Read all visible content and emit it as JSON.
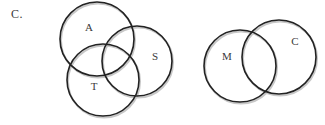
{
  "option_label": "C.",
  "diagrams": [
    {
      "name": "three-set-venn",
      "sets": [
        {
          "label": "A",
          "cx": 97,
          "cy": 39,
          "r": 37,
          "label_x": 89,
          "label_y": 27
        },
        {
          "label": "S",
          "cx": 137,
          "cy": 61,
          "r": 35,
          "label_x": 155,
          "label_y": 56
        },
        {
          "label": "T",
          "cx": 103,
          "cy": 80,
          "r": 36,
          "label_x": 94,
          "label_y": 86
        }
      ]
    },
    {
      "name": "two-set-venn",
      "sets": [
        {
          "label": "M",
          "cx": 240,
          "cy": 66,
          "r": 36,
          "label_x": 227,
          "label_y": 56
        },
        {
          "label": "C",
          "cx": 279,
          "cy": 57,
          "r": 37,
          "label_x": 295,
          "label_y": 41
        }
      ]
    }
  ],
  "colors": {
    "stroke": "#222222",
    "shadow": "#c8c8c8",
    "text": "#3a3a3a",
    "background": "#ffffff"
  }
}
